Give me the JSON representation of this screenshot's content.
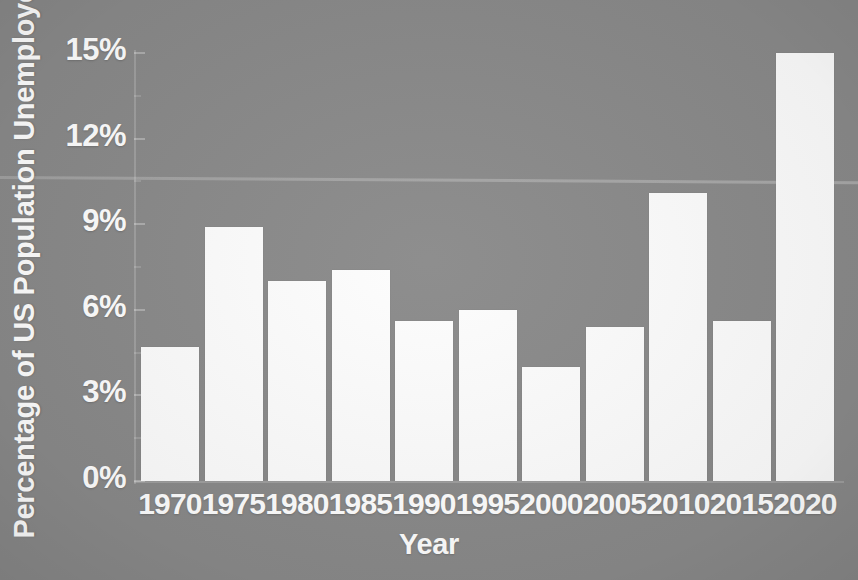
{
  "chart_data": {
    "type": "bar",
    "title": "",
    "xlabel": "Year",
    "ylabel": "Percentage of US Population Unemployed",
    "categories": [
      "1970",
      "1975",
      "1980",
      "1985",
      "1990",
      "1995",
      "2000",
      "2005",
      "2010",
      "2015",
      "2020"
    ],
    "values": [
      4.7,
      8.9,
      7.0,
      7.4,
      5.6,
      6.0,
      4.0,
      5.4,
      10.1,
      5.6,
      15.0
    ],
    "value_labels": [
      "4.7%",
      "8.9%",
      "7.0%",
      "7.4%",
      "5.6%",
      "6.0%",
      "4.0%",
      "5.4%",
      "10.1%",
      "5.6%",
      "15.0%"
    ],
    "ylim": [
      0,
      15
    ],
    "ytick_values": [
      0,
      3,
      6,
      9,
      12,
      15
    ],
    "ytick_labels": [
      "0%",
      "3%",
      "6%",
      "9%",
      "12%",
      "15%"
    ],
    "grid": false,
    "legend": null,
    "bar_color": "#fdfdfd",
    "background_color": "#8a8a8a",
    "text_color": "#ffffff"
  },
  "axes": {
    "y_title": "Percentage of US Population Unemployed",
    "x_title": "Year"
  }
}
